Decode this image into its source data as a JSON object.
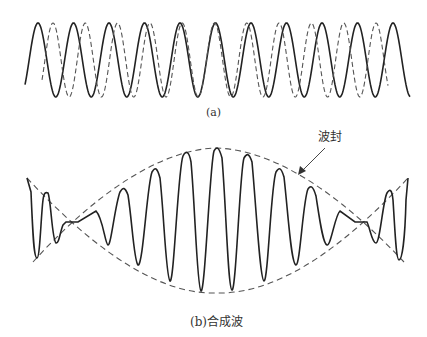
{
  "figure_a": {
    "caption": "(a)",
    "waves": [
      {
        "name": "wave-1",
        "style": "solid",
        "period_px": 35.5,
        "start_x": 25,
        "end_x": 410
      },
      {
        "name": "wave-2",
        "style": "dashed",
        "period_px": 32.3,
        "start_x": 42,
        "end_x": 388
      }
    ]
  },
  "figure_b": {
    "caption": "(b)合成波",
    "envelope_label": "波封",
    "waves": [
      {
        "name": "composite-wave",
        "style": "solid"
      },
      {
        "name": "envelope",
        "style": "dashed"
      }
    ]
  },
  "colors": {
    "solid": "#222222",
    "dashed": "#555555",
    "background": "#ffffff"
  }
}
